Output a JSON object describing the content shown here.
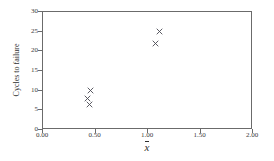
{
  "chart_data": {
    "type": "scatter",
    "title": "",
    "xlabel": "x̄",
    "xlabel_symbol": "x",
    "ylabel": "Cycles to failure",
    "xlim": [
      0.0,
      2.0
    ],
    "ylim": [
      0,
      30
    ],
    "xticks": [
      0.0,
      0.5,
      1.0,
      1.5,
      2.0
    ],
    "xtick_labels": [
      "0.00",
      "0.50",
      "1.00",
      "1.50",
      "2.00"
    ],
    "yticks": [
      0,
      5,
      10,
      15,
      20,
      25,
      30
    ],
    "ytick_labels": [
      "0",
      "5",
      "10",
      "15",
      "20",
      "25",
      "30"
    ],
    "grid": false,
    "legend": false,
    "marker": "x",
    "marker_color": "#4a4a52",
    "frame_color": "#6b6b6b",
    "background": "#ffffff",
    "series": [
      {
        "name": "Cycles to failure",
        "points": [
          {
            "x": 0.45,
            "y": 10
          },
          {
            "x": 0.42,
            "y": 8
          },
          {
            "x": 0.44,
            "y": 6.5
          },
          {
            "x": 1.11,
            "y": 25
          },
          {
            "x": 1.07,
            "y": 22
          }
        ]
      }
    ]
  }
}
